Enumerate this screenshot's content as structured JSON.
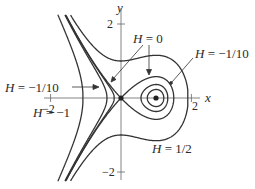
{
  "figure": {
    "type": "phase-portrait",
    "hamiltonian": "H = y^2/2 - x^2/2 + x^3/3",
    "axes": {
      "x_label": "x",
      "y_label": "y",
      "x_ticks": [
        {
          "value": -2,
          "label": "−2"
        },
        {
          "value": 2,
          "label": "2"
        }
      ],
      "y_ticks": [
        {
          "value": 2,
          "label": "2"
        },
        {
          "value": -2,
          "label": "−2"
        }
      ],
      "color": "#555555"
    },
    "origin_px": [
      121,
      98
    ],
    "scale_px": [
      35.2,
      37
    ],
    "curve_color": "#333333",
    "level_values": [
      0.5,
      0,
      -0.1,
      -1
    ],
    "equilibria": [
      {
        "name": "saddle",
        "x": 0,
        "y": 0
      },
      {
        "name": "center",
        "x": 1,
        "y": 0
      }
    ],
    "labels": [
      {
        "id": "h0",
        "text_h": "H",
        "text_rest": " = 0"
      },
      {
        "id": "hm110_right",
        "text_h": "H",
        "text_rest": " = −1/10"
      },
      {
        "id": "hm110_left",
        "text_h": "H",
        "text_rest": " = −1/10"
      },
      {
        "id": "hm1",
        "text_h": "H",
        "text_rest": " = −1"
      },
      {
        "id": "h12",
        "text_h": "H",
        "text_rest": " = 1/2"
      }
    ]
  }
}
